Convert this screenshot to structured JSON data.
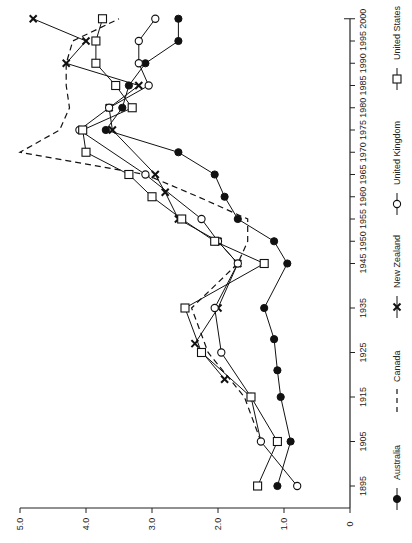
{
  "chart_data": {
    "type": "line",
    "orientation": "rotated-90",
    "title": "",
    "xlabel": "",
    "ylabel": "",
    "value_axis": {
      "ticks": [
        0,
        1.0,
        2.0,
        3.0,
        4.0,
        5.0
      ],
      "tick_labels": [
        "0",
        "1.0",
        "2.0",
        "3.0",
        "4.0",
        "5.0"
      ],
      "range": [
        0,
        5.0
      ]
    },
    "year_axis": {
      "ticks": [
        1895,
        1905,
        1915,
        1925,
        1935,
        1945,
        1950,
        1955,
        1960,
        1965,
        1970,
        1975,
        1980,
        1985,
        1990,
        1995,
        2000
      ],
      "tick_labels": [
        "1895",
        "1905",
        "1915",
        "1925",
        "1935",
        "1945",
        "1950",
        "1955",
        "1960",
        "1965",
        "1970",
        "1975",
        "1980",
        "1985",
        "1990",
        "1995",
        "2000"
      ],
      "range": [
        1890,
        2000
      ]
    },
    "grid": false,
    "legend_position": "right (rotated, bottom-to-top)",
    "series": [
      {
        "name": "Australia",
        "marker": "filled-circle",
        "line": "solid",
        "points": [
          [
            1895,
            1.1
          ],
          [
            1905,
            0.9
          ],
          [
            1915,
            1.05
          ],
          [
            1921,
            1.1
          ],
          [
            1928,
            1.15
          ],
          [
            1935,
            1.3
          ],
          [
            1945,
            0.95
          ],
          [
            1950,
            1.15
          ],
          [
            1955,
            1.7
          ],
          [
            1960,
            1.9
          ],
          [
            1965,
            2.05
          ],
          [
            1970,
            2.6
          ],
          [
            1975,
            3.7
          ],
          [
            1980,
            3.45
          ],
          [
            1985,
            3.35
          ],
          [
            1990,
            3.1
          ],
          [
            1995,
            2.6
          ],
          [
            2000,
            2.6
          ]
        ]
      },
      {
        "name": "Canada",
        "marker": "none",
        "line": "dashed",
        "points": [
          [
            1905,
            1.35
          ],
          [
            1915,
            1.6
          ],
          [
            1925,
            2.15
          ],
          [
            1935,
            2.4
          ],
          [
            1945,
            1.7
          ],
          [
            1950,
            1.55
          ],
          [
            1955,
            1.55
          ],
          [
            1960,
            2.3
          ],
          [
            1965,
            3.1
          ],
          [
            1970,
            5.0
          ],
          [
            1975,
            4.4
          ],
          [
            1980,
            4.25
          ],
          [
            1985,
            4.3
          ],
          [
            1990,
            4.3
          ],
          [
            1995,
            4.2
          ],
          [
            2000,
            3.5
          ]
        ]
      },
      {
        "name": "New Zealand",
        "marker": "x",
        "line": "solid",
        "points": [
          [
            1919,
            1.9
          ],
          [
            1927,
            2.35
          ],
          [
            1935,
            2.0
          ],
          [
            1945,
            1.7
          ],
          [
            1950,
            2.0
          ],
          [
            1955,
            2.6
          ],
          [
            1961,
            2.8
          ],
          [
            1965,
            2.95
          ],
          [
            1975,
            3.6
          ],
          [
            1980,
            3.65
          ],
          [
            1985,
            3.2
          ],
          [
            1990,
            4.3
          ],
          [
            1995,
            4.0
          ],
          [
            2000,
            4.8
          ]
        ]
      },
      {
        "name": "United Kingdom",
        "marker": "open-circle",
        "line": "solid",
        "points": [
          [
            1895,
            0.8
          ],
          [
            1905,
            1.35
          ],
          [
            1915,
            1.5
          ],
          [
            1925,
            1.95
          ],
          [
            1935,
            2.05
          ],
          [
            1945,
            1.7
          ],
          [
            1950,
            2.0
          ],
          [
            1955,
            2.25
          ],
          [
            1965,
            3.1
          ],
          [
            1975,
            4.1
          ],
          [
            1980,
            3.65
          ],
          [
            1985,
            3.05
          ],
          [
            1990,
            3.2
          ],
          [
            1995,
            3.2
          ],
          [
            2000,
            2.95
          ]
        ]
      },
      {
        "name": "United States",
        "marker": "open-square",
        "line": "solid",
        "points": [
          [
            1895,
            1.4
          ],
          [
            1905,
            1.1
          ],
          [
            1915,
            1.5
          ],
          [
            1925,
            2.25
          ],
          [
            1935,
            2.5
          ],
          [
            1945,
            1.3
          ],
          [
            1950,
            2.05
          ],
          [
            1955,
            2.55
          ],
          [
            1960,
            3.0
          ],
          [
            1965,
            3.35
          ],
          [
            1970,
            4.0
          ],
          [
            1975,
            4.05
          ],
          [
            1980,
            3.3
          ],
          [
            1985,
            3.55
          ],
          [
            1990,
            3.85
          ],
          [
            1995,
            3.85
          ],
          [
            2000,
            3.75
          ]
        ]
      }
    ]
  },
  "legend": {
    "items": [
      {
        "label": "Australia",
        "symbol": "filled-circle"
      },
      {
        "label": "Canada",
        "symbol": "dash"
      },
      {
        "label": "New Zealand",
        "symbol": "x"
      },
      {
        "label": "United Kingdom",
        "symbol": "open-circle"
      },
      {
        "label": "United States",
        "symbol": "open-square"
      }
    ]
  }
}
